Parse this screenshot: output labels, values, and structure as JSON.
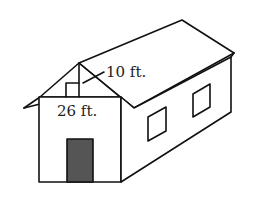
{
  "figure": {
    "type": "house-diagram",
    "labels": {
      "height": "10 ft.",
      "width": "26 ft."
    },
    "colors": {
      "stroke": "#111111",
      "door_fill": "#555555",
      "background": "#ffffff"
    }
  }
}
